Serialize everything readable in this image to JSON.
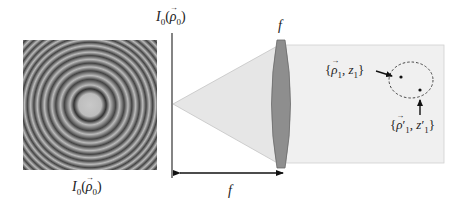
{
  "diagram": {
    "pattern": {
      "label_main": "I",
      "label_sub": "0",
      "label_arg": "ρ",
      "label_arg_sub": "0",
      "ring_count": 16
    },
    "plane_label": {
      "main": "I",
      "sub": "0",
      "arg": "ρ",
      "arg_sub": "0"
    },
    "lens_label": "f",
    "distance_label": "f",
    "point1_label": {
      "open": "{",
      "arg": "ρ",
      "arg_sub": "1",
      "sep": ", ",
      "z": "z",
      "z_sub": "1",
      "close": "}"
    },
    "point2_label": {
      "open": "{",
      "arg": "ρ",
      "arg_prime": "′",
      "arg_sub": "1",
      "sep": ", ",
      "z": "z",
      "z_prime": "′",
      "z_sub": "1",
      "close": "}"
    },
    "colors": {
      "cone_fill": "#e8e8e8",
      "beam_fill": "#f0f0f0",
      "lens_fill": "#8c8c8c",
      "line": "#333333"
    }
  }
}
